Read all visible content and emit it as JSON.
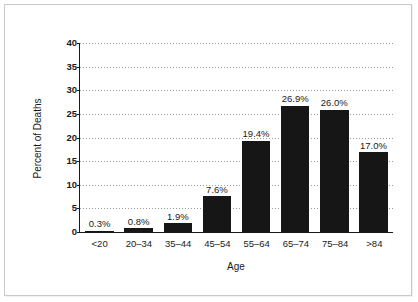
{
  "chart_data": {
    "type": "bar",
    "title": "",
    "xlabel": "Age",
    "ylabel": "Percent of Deaths",
    "categories": [
      "<20",
      "20–34",
      "35–44",
      "45–54",
      "55–64",
      "65–74",
      "75–84",
      ">84"
    ],
    "values": [
      0.3,
      0.8,
      1.9,
      7.6,
      19.4,
      26.9,
      26.0,
      17.0
    ],
    "bar_labels": [
      "0.3%",
      "0.8%",
      "1.9%",
      "7.6%",
      "19.4%",
      "26.9%",
      "26.0%",
      "17.0%"
    ],
    "ylim": [
      0,
      40
    ],
    "yticks": [
      0,
      5,
      10,
      15,
      20,
      25,
      30,
      35,
      40
    ],
    "ytick_labels": [
      "0",
      "5",
      "10",
      "15",
      "20",
      "25",
      "30",
      "35",
      "40"
    ],
    "grid": true,
    "grid_orientation": "horizontal",
    "grid_style": "dotted",
    "legend": false,
    "bar_color": "#161616",
    "background_color": "#ffffff",
    "axis_color": "#1a1a1a",
    "grid_color": "#9a9a9a",
    "frame_color": "#c9c9c9"
  }
}
